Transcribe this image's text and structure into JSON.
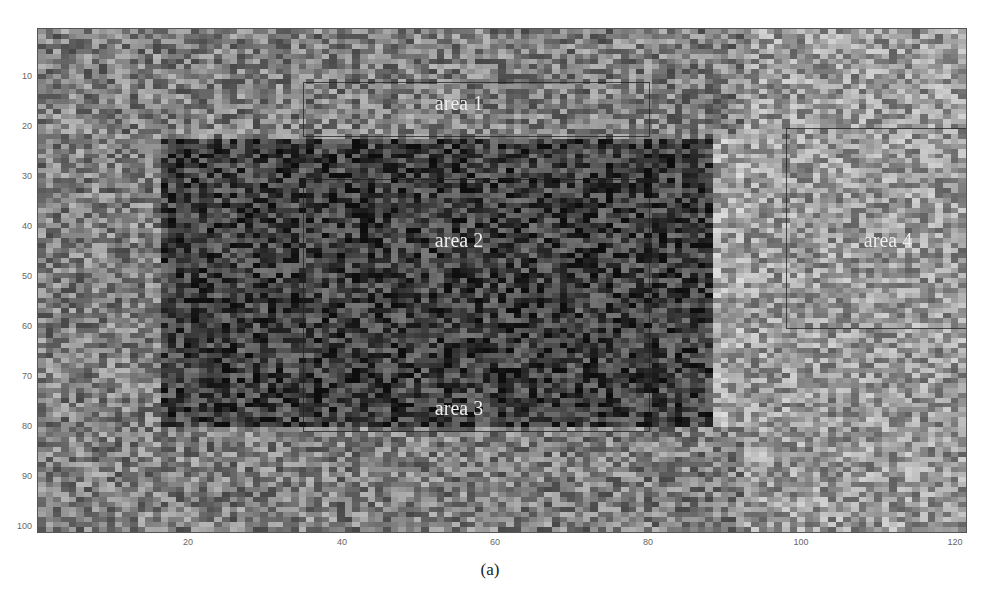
{
  "chart_data": {
    "type": "heatmap",
    "title": "",
    "caption": "(a)",
    "xlabel": "",
    "ylabel": "",
    "grid": false,
    "colormap": "grayscale",
    "columns": 121,
    "rows": 101,
    "xlim": [
      1,
      121
    ],
    "ylim": [
      1,
      101
    ],
    "y_inverted": true,
    "x_ticks": [
      20,
      40,
      60,
      80,
      100,
      120
    ],
    "y_ticks": [
      10,
      20,
      30,
      40,
      50,
      60,
      70,
      80,
      90,
      100
    ],
    "background_level": 0.5,
    "regions": [
      {
        "name": "dark block",
        "x_range": [
          17,
          89
        ],
        "y_range": [
          23,
          80
        ],
        "mean_level": 0.25
      },
      {
        "name": "light halo",
        "x_range": [
          89,
          93
        ],
        "y_range": [
          23,
          80
        ],
        "mean_level": 0.65
      },
      {
        "name": "light right band",
        "x_range": [
          93,
          121
        ],
        "y_range": [
          1,
          101
        ],
        "mean_level": 0.6
      }
    ],
    "annotations": [
      {
        "label": "area 1",
        "box": {
          "x0": 35,
          "x1": 80,
          "y0": 11,
          "y1": 22
        },
        "label_pos": {
          "x": 57,
          "y": 16
        }
      },
      {
        "label": "area 2",
        "box": {
          "x0": 35,
          "x1": 80,
          "y0": 31,
          "y1": 81
        },
        "label_pos": {
          "x": 57,
          "y": 43
        }
      },
      {
        "label": "area 3",
        "box": {
          "x0": 35,
          "x1": 80,
          "y0": 31,
          "y1": 81
        },
        "label_pos": {
          "x": 57,
          "y": 76
        }
      },
      {
        "label": "area 4",
        "box": {
          "x0": 98,
          "x1": 121,
          "y0": 20,
          "y1": 60
        },
        "label_pos": {
          "x": 110,
          "y": 43
        }
      }
    ]
  },
  "axes": {
    "y_ticks": [
      "10",
      "20",
      "30",
      "40",
      "50",
      "60",
      "70",
      "80",
      "90",
      "100"
    ],
    "x_ticks": [
      "20",
      "40",
      "60",
      "80",
      "100",
      "120"
    ]
  },
  "labels": {
    "area1": "area 1",
    "area2": "area 2",
    "area3": "area 3",
    "area4": "area 4",
    "caption": "(a)"
  }
}
